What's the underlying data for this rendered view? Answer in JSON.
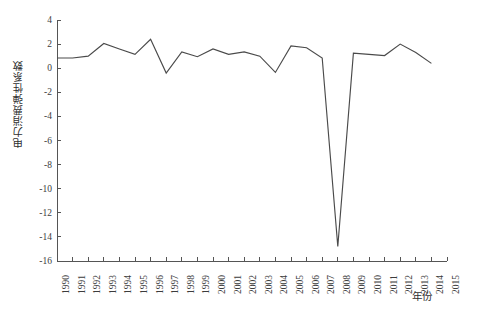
{
  "chart_data": {
    "type": "line",
    "title": "",
    "xlabel": "年份",
    "ylabel": "电力消费弹性系数",
    "x": [
      1990,
      1991,
      1992,
      1993,
      1994,
      1995,
      1996,
      1997,
      1998,
      1999,
      2000,
      2001,
      2002,
      2003,
      2004,
      2005,
      2006,
      2007,
      2008,
      2009,
      2010,
      2011,
      2012,
      2013,
      2014
    ],
    "values": [
      0.85,
      0.85,
      1.0,
      2.05,
      1.6,
      1.15,
      2.4,
      -0.4,
      1.35,
      0.95,
      1.6,
      1.15,
      1.35,
      1.0,
      -0.35,
      1.85,
      1.7,
      0.85,
      -14.8,
      1.25,
      1.15,
      1.05,
      2.0,
      1.3,
      0.4
    ],
    "series": [
      {
        "name": "电力消费弹性系数",
        "values": [
          0.85,
          0.85,
          1.0,
          2.05,
          1.6,
          1.15,
          2.4,
          -0.4,
          1.35,
          0.95,
          1.6,
          1.15,
          1.35,
          1.0,
          -0.35,
          1.85,
          1.7,
          0.85,
          -14.8,
          1.25,
          1.15,
          1.05,
          2.0,
          1.3,
          0.4
        ]
      }
    ],
    "xlim": [
      1990,
      2015
    ],
    "ylim": [
      -16,
      4
    ],
    "x_tick_labels": [
      "1990",
      "1991",
      "1992",
      "1993",
      "1994",
      "1995",
      "1996",
      "1997",
      "1998",
      "1999",
      "2000",
      "2001",
      "2002",
      "2003",
      "2004",
      "2005",
      "2006",
      "2007",
      "2008",
      "2009",
      "2010",
      "2011",
      "2012",
      "2013",
      "2014",
      "2015"
    ],
    "x_ticks": [
      1990,
      1991,
      1992,
      1993,
      1994,
      1995,
      1996,
      1997,
      1998,
      1999,
      2000,
      2001,
      2002,
      2003,
      2004,
      2005,
      2006,
      2007,
      2008,
      2009,
      2010,
      2011,
      2012,
      2013,
      2014,
      2015
    ],
    "y_tick_labels": [
      "4",
      "2",
      "0",
      "-2",
      "-4",
      "-6",
      "-8",
      "-10",
      "-12",
      "-14",
      "-16"
    ],
    "y_ticks": [
      4,
      2,
      0,
      -2,
      -4,
      -6,
      -8,
      -10,
      -12,
      -14,
      -16
    ],
    "grid": false,
    "legend": "none",
    "line_color": "#4a4a4a",
    "axis_color": "#555555"
  }
}
